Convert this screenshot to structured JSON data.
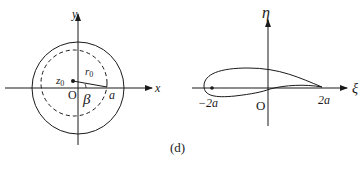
{
  "figure": {
    "caption": "(d)",
    "left_panel": {
      "x_axis_label": "x",
      "y_axis_label": "y",
      "origin_label": "O",
      "center_label": "z",
      "center_subscript": "0",
      "radius_label": "r",
      "radius_subscript": "0",
      "angle_label": "β",
      "intercept_label": "a"
    },
    "right_panel": {
      "x_axis_label": "ξ",
      "y_axis_label": "η",
      "origin_label": "O",
      "left_point_label": "−2a",
      "right_point_label": "2a"
    }
  }
}
